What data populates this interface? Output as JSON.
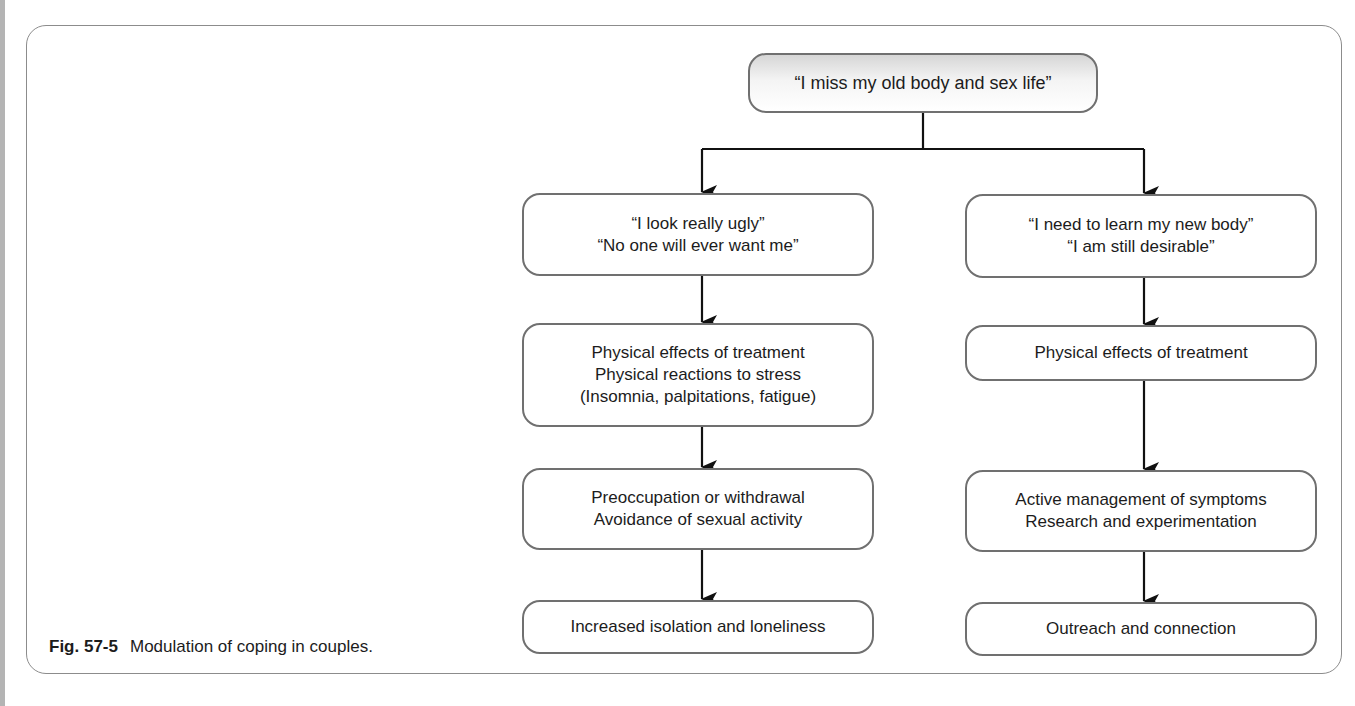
{
  "figure": {
    "label": "Fig. 57-5",
    "caption": "Modulation of coping in couples."
  },
  "root": {
    "lines": [
      "“I miss my old body and sex life”"
    ]
  },
  "left_branch": {
    "nodes": [
      {
        "lines": [
          "“I look really ugly”",
          "“No one will ever want me”"
        ]
      },
      {
        "lines": [
          "Physical effects of treatment",
          "Physical reactions to stress",
          "(Insomnia, palpitations, fatigue)"
        ]
      },
      {
        "lines": [
          "Preoccupation or withdrawal",
          "Avoidance of sexual activity"
        ]
      },
      {
        "lines": [
          "Increased isolation and loneliness"
        ]
      }
    ]
  },
  "right_branch": {
    "nodes": [
      {
        "lines": [
          "“I need to learn my new body”",
          "“I am still desirable”"
        ]
      },
      {
        "lines": [
          "Physical effects of treatment"
        ]
      },
      {
        "lines": [
          "Active management of symptoms",
          "Research and experimentation"
        ]
      },
      {
        "lines": [
          "Outreach and connection"
        ]
      }
    ]
  },
  "colors": {
    "node_border": "#707070",
    "connector": "#111111",
    "frame_border": "#8c8c8c",
    "root_gradient_top": "#d6d6d6"
  }
}
